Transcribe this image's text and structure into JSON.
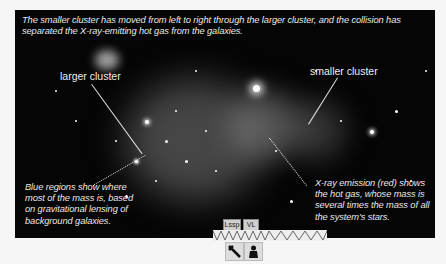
{
  "figure": {
    "caption_top": "The smaller cluster has moved from left to right through the larger cluster, and the collision has separated the X-ray-emitting hot gas from the galaxies.",
    "label_larger": "larger cluster",
    "label_smaller": "smaller cluster",
    "caption_blue": "Blue regions show where most of the mass is, based on gravitational lensing of background galaxies.",
    "caption_xray": "X-ray emission (red) shows the hot gas, whose mass is several times the mass of all the system's stars."
  },
  "widget": {
    "button_1": "Lssp",
    "button_2": "VL",
    "icon_1": "telescope-icon",
    "icon_2": "pawn-icon"
  }
}
